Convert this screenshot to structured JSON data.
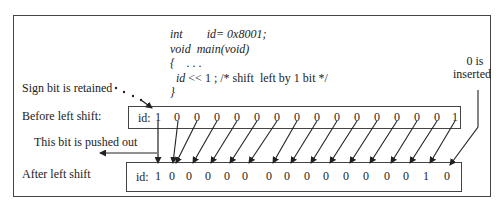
{
  "code": {
    "lines": [
      {
        "kw": "int",
        "rest": "        id= 0x8001;"
      },
      {
        "kw": "void",
        "rest": "  main(void)"
      },
      {
        "kw": "{",
        "rest": "    . . ."
      },
      {
        "kw": "  id",
        "rest": " << 1 ; /* shift  left by 1 bit */"
      },
      {
        "kw": "}",
        "rest": ""
      }
    ]
  },
  "labels": {
    "sign_bit": "Sign bit is  retained",
    "before": "Before left shift:",
    "pushed_out": "This bit is pushed out",
    "after": "After left shift",
    "zero_is": "0 is",
    "inserted": "inserted"
  },
  "registers": {
    "before": {
      "name": "id:",
      "bits": [
        "1",
        "0",
        "0",
        "0",
        "0",
        "0",
        "0",
        "0",
        "0",
        "0",
        "0",
        "0",
        "0",
        "0",
        "0",
        "1"
      ]
    },
    "after": {
      "name": "id:",
      "bits": [
        "1",
        "0",
        "0",
        "0",
        "0",
        "0",
        "0",
        "0",
        "0",
        "0",
        "0",
        "0",
        "0",
        "0",
        "1",
        "0"
      ]
    }
  }
}
